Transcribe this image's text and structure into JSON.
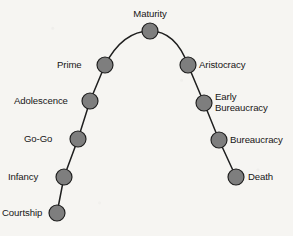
{
  "diagram": {
    "background_color": "#f6f5f2",
    "node_fill_color": "#7e7e7e",
    "node_stroke_color": "#1d1d1d",
    "curve_color": "#1f1f1f",
    "node_radius": 8,
    "nodes": [
      {
        "id": "courtship",
        "label": "Courtship",
        "x": 57,
        "y": 213,
        "label_side": "left",
        "label_x": 2,
        "label_y": 208
      },
      {
        "id": "infancy",
        "label": "Infancy",
        "x": 64,
        "y": 177,
        "label_side": "left",
        "label_x": 8,
        "label_y": 172
      },
      {
        "id": "go-go",
        "label": "Go-Go",
        "x": 78,
        "y": 139,
        "label_side": "left",
        "label_x": 24,
        "label_y": 134
      },
      {
        "id": "adolescence",
        "label": "Adolescence",
        "x": 90,
        "y": 101,
        "label_side": "left",
        "label_x": 14,
        "label_y": 96
      },
      {
        "id": "prime",
        "label": "Prime",
        "x": 105,
        "y": 65,
        "label_side": "left",
        "label_x": 57,
        "label_y": 60
      },
      {
        "id": "maturity",
        "label": "Maturity",
        "x": 150,
        "y": 31,
        "label_side": "top",
        "label_x": 122,
        "label_y": 9
      },
      {
        "id": "aristocracy",
        "label": "Aristocracy",
        "x": 188,
        "y": 65,
        "label_side": "right",
        "label_x": 199,
        "label_y": 60
      },
      {
        "id": "early-bureaucracy",
        "label": "Early\nBureaucracy",
        "x": 204,
        "y": 103,
        "label_side": "right",
        "label_x": 215,
        "label_y": 92
      },
      {
        "id": "bureaucracy",
        "label": "Bureaucracy",
        "x": 219,
        "y": 140,
        "label_side": "right",
        "label_x": 230,
        "label_y": 135
      },
      {
        "id": "death",
        "label": "Death",
        "x": 236,
        "y": 177,
        "label_side": "right",
        "label_x": 248,
        "label_y": 172
      }
    ],
    "curve_path": "M 57 213 L 64 177 L 78 139 L 90 101 L 105 65 C 116 44 131 31 150 31 C 169 31 181 46 188 65 L 204 103 L 219 140 L 236 177"
  }
}
